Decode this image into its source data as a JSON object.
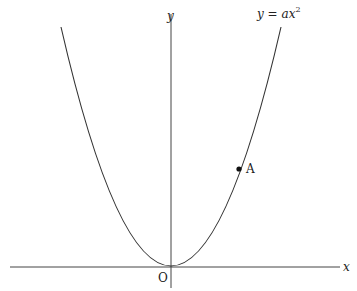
{
  "diagram": {
    "type": "function-graph",
    "equation": {
      "lhs": "y",
      "eq": " = ",
      "coef": "a",
      "var": "x",
      "exp": "2"
    },
    "axes": {
      "x_label": "x",
      "y_label": "y",
      "origin_label": "O"
    },
    "points": [
      {
        "label": "A",
        "on_curve": true,
        "quadrant": "I"
      }
    ],
    "colors": {
      "curve": "#333333",
      "axis": "#444444",
      "point": "#111111",
      "background": "#ffffff"
    }
  }
}
